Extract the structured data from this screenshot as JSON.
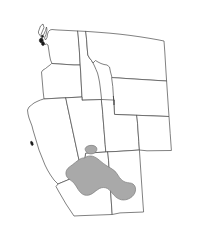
{
  "figure": {
    "kind": "species-range-map",
    "region_title": "Western United States",
    "width_px": 202,
    "height_px": 248,
    "background_color": "#ffffff"
  },
  "style": {
    "border_color": "#4a4a4a",
    "border_width_px": 0.7,
    "land_fill": "#ffffff",
    "range_fill": "#a9a9a9",
    "range_stroke": "#7d7d7d",
    "island_fill": "#1a1a1a"
  },
  "states": [
    {
      "name": "Washington",
      "code": "WA",
      "shaded": false,
      "path": "M 38.5 31.5 L 40.5 26.0 L 43.0 24.0 L 44.0 27.5 L 42.5 31.0 L 41.0 34.5 L 42.0 36.5 L 44.0 34.0 L 45.5 30.5 L 46.5 27.0 L 47.0 30.0 L 46.0 34.5 L 44.5 38.0 L 45.5 40.0 L 47.0 37.5 L 47.5 34.0 L 48.5 31.5 L 50.0 30.0 L 52.0 29.5 L 55.0 29.8 L 58.0 30.0 L 62.0 30.2 L 66.0 30.4 L 70.0 30.6 L 74.0 30.8 L 78.0 31.0 L 79.2 48.0 L 79.8 58.0 L 80.2 65.0 L 74.0 65.0 L 68.0 64.6 L 62.0 64.2 L 56.0 63.8 L 52.0 63.5 L 50.5 60.0 L 49.5 55.0 L 48.8 50.0 L 48.0 45.0 L 46.5 44.0 L 45.0 44.5 L 43.5 43.0 L 43.0 40.0 L 42.0 38.0 L 40.5 36.0 L 39.0 34.0 Z"
    },
    {
      "name": "Oregon",
      "code": "OR",
      "shaded": false,
      "path": "M 52.0 63.5 L 56.0 63.8 L 62.0 64.2 L 68.0 64.6 L 74.0 65.0 L 80.2 65.0 L 80.8 74.0 L 81.2 82.0 L 81.6 90.0 L 82.0 97.0 L 74.0 97.4 L 66.0 97.8 L 58.0 98.2 L 50.0 98.6 L 44.0 99.0 L 43.2 92.0 L 42.6 85.0 L 42.0 78.0 L 41.5 72.0 L 43.0 70.0 L 45.5 68.5 L 48.0 66.5 L 50.0 65.0 Z"
    },
    {
      "name": "Idaho",
      "code": "ID",
      "shaded": false,
      "path": "M 78.0 31.0 L 82.0 31.2 L 86.0 31.4 L 86.6 40.0 L 87.2 48.0 L 87.8 55.0 L 89.5 58.0 L 91.5 60.5 L 93.0 63.0 L 94.5 66.0 L 96.0 69.5 L 97.5 73.0 L 98.5 77.0 L 99.5 82.0 L 100.3 88.0 L 101.0 94.0 L 101.6 99.5 L 94.0 99.8 L 88.0 100.0 L 82.0 100.2 L 82.0 97.0 L 81.6 90.0 L 81.2 82.0 L 80.8 74.0 L 80.2 65.0 L 79.8 58.0 L 79.2 48.0 Z"
    },
    {
      "name": "Montana",
      "code": "MT",
      "shaded": false,
      "path": "M 86.0 31.4 L 92.0 31.8 L 100.0 32.4 L 110.0 33.2 L 120.0 34.2 L 130.0 35.4 L 140.0 36.8 L 150.0 38.4 L 158.0 39.8 L 164.0 41.0 L 164.8 52.0 L 165.4 62.0 L 166.0 72.0 L 166.6 81.0 L 158.0 80.5 L 150.0 80.0 L 142.0 79.5 L 134.0 79.0 L 126.0 78.5 L 119.0 78.0 L 112.0 77.6 L 110.5 72.0 L 109.5 67.0 L 107.0 65.0 L 104.0 64.5 L 101.0 63.5 L 98.0 62.0 L 95.5 60.5 L 93.0 63.0 L 91.5 60.5 L 89.5 58.0 L 87.8 55.0 L 87.2 48.0 L 86.6 40.0 Z"
    },
    {
      "name": "Wyoming",
      "code": "WY",
      "shaded": false,
      "path": "M 112.0 77.6 L 119.0 78.0 L 126.0 78.5 L 134.0 79.0 L 142.0 79.5 L 150.0 80.0 L 158.0 80.5 L 166.6 81.0 L 167.2 90.0 L 167.8 99.0 L 168.4 108.0 L 169.0 116.5 L 161.0 116.2 L 153.0 115.9 L 145.0 115.6 L 137.0 115.3 L 129.0 115.0 L 121.0 114.7 L 114.5 114.4 L 114.0 105.0 L 113.4 96.0 L 112.8 87.0 Z"
    },
    {
      "name": "California",
      "code": "CA",
      "shaded": false,
      "path": "M 44.0 99.0 L 50.0 98.6 L 58.0 98.2 L 66.0 97.8 L 67.0 104.0 L 68.5 111.0 L 70.0 118.0 L 71.5 125.0 L 73.0 132.0 L 74.5 139.0 L 76.0 146.0 L 77.5 153.0 L 79.0 160.0 L 80.5 167.0 L 82.0 174.0 L 76.0 176.5 L 70.0 179.0 L 64.0 181.5 L 58.0 184.0 L 54.0 180.0 L 50.5 175.0 L 47.5 170.0 L 45.0 165.0 L 43.0 160.0 L 41.0 155.0 L 39.0 150.0 L 37.5 145.0 L 36.0 140.0 L 34.5 135.0 L 33.0 130.0 L 32.0 126.0 L 30.5 122.0 L 29.0 118.0 L 28.0 114.0 L 27.5 110.0 L 29.0 107.0 L 31.5 105.0 L 34.0 103.0 L 37.0 101.5 L 40.0 100.2 Z"
    },
    {
      "name": "Nevada",
      "code": "NV",
      "shaded": false,
      "path": "M 66.0 97.8 L 74.0 97.4 L 82.0 97.0 L 82.0 100.2 L 88.0 100.0 L 94.0 99.8 L 101.6 99.5 L 102.2 107.0 L 102.8 114.5 L 103.4 122.0 L 104.0 129.5 L 104.6 137.0 L 105.2 144.5 L 105.8 152.0 L 99.0 152.4 L 92.0 152.8 L 86.0 153.2 L 82.0 174.0 L 80.5 167.0 L 79.0 160.0 L 77.5 153.0 L 76.0 146.0 L 74.5 139.0 L 73.0 132.0 L 71.5 125.0 L 70.0 118.0 L 68.5 111.0 L 67.0 104.0 Z"
    },
    {
      "name": "Utah",
      "code": "UT",
      "shaded": true,
      "path": "M 101.6 99.5 L 108.0 99.8 L 114.5 100.1 L 114.0 105.0 L 113.4 96.0 L 114.5 114.4 L 121.0 114.7 L 129.0 115.0 L 137.0 115.3 L 137.6 124.0 L 138.2 133.0 L 138.8 141.5 L 139.4 150.0 L 132.0 150.5 L 124.0 151.0 L 116.0 151.5 L 108.0 151.8 L 105.8 152.0 L 105.2 144.5 L 104.6 137.0 L 104.0 129.5 L 103.4 122.0 L 102.8 114.5 L 102.2 107.0 Z"
    },
    {
      "name": "Colorado",
      "code": "CO",
      "shaded": false,
      "path": "M 137.0 115.3 L 145.0 115.6 L 153.0 115.9 L 161.0 116.2 L 169.0 116.5 L 169.6 125.0 L 170.2 133.5 L 170.8 142.0 L 171.4 150.5 L 163.0 150.6 L 155.0 150.7 L 147.0 150.8 L 139.4 150.0 L 138.8 141.5 L 138.2 133.0 L 137.6 124.0 Z"
    },
    {
      "name": "Arizona",
      "code": "AZ",
      "shaded": true,
      "path": "M 86.0 153.2 L 92.0 152.8 L 99.0 152.4 L 105.8 152.0 L 108.0 151.8 L 108.6 161.0 L 109.2 170.0 L 109.8 179.0 L 110.4 188.0 L 111.0 197.0 L 111.6 206.0 L 112.2 214.5 L 104.0 214.8 L 96.0 215.1 L 88.0 215.4 L 80.0 215.7 L 74.0 216.0 L 70.0 210.0 L 66.0 204.0 L 62.5 198.0 L 59.0 192.0 L 56.0 186.5 L 58.0 184.0 L 64.0 181.5 L 70.0 179.0 L 76.0 176.5 L 82.0 174.0 L 84.0 164.0 Z"
    },
    {
      "name": "New Mexico",
      "code": "NM",
      "shaded": true,
      "path": "M 108.0 151.8 L 116.0 151.5 L 124.0 151.0 L 132.0 150.5 L 139.4 150.0 L 140.0 159.0 L 140.6 168.0 L 141.2 177.0 L 141.8 186.0 L 142.4 195.0 L 143.0 204.0 L 143.6 212.0 L 136.0 212.3 L 128.0 212.6 L 120.0 212.9 L 112.2 214.5 L 111.6 206.0 L 111.0 197.0 L 110.4 188.0 L 109.8 179.0 L 109.2 170.0 L 108.6 161.0 Z"
    }
  ],
  "coast_details": [
    {
      "name": "puget-sound-islands",
      "description": "dark islands in Puget Sound, northwest Washington",
      "path": "M 42.3 38.6 a 1.9 2.3 0 1 0 0.1 0.1 Z M 44.0 42.2 a 1.6 1.9 0 1 0 0.1 0.1 Z M 43.2 35.4 a 1.0 1.2 0 1 0 0.1 0.1 Z"
    },
    {
      "name": "san-francisco-bay",
      "description": "dark bay notch on the central California coast",
      "path": "M 31.2 141.0 l 1.6 1.2 l 0.6 2.6 l -1.4 1.0 l -1.2 -1.8 l -0.4 -2.0 Z"
    }
  ],
  "range": {
    "label": "shaded distribution range",
    "fill_color": "#a9a9a9",
    "outline_color": "#7d7d7d",
    "lobes": [
      {
        "name": "southern-utah-lobe",
        "description": "small detached patch straddling the Utah-Arizona border",
        "path": "M 86.5 152.0 C 85.0 150.4 84.6 148.6 86.0 147.2 C 88.0 145.4 91.5 144.8 94.2 145.8 C 96.6 146.7 97.4 148.6 96.6 150.6 C 95.9 152.4 94.0 153.6 91.8 153.9 C 89.6 154.2 87.6 153.3 86.5 152.0 Z"
      },
      {
        "name": "main-arizona-lobe",
        "description": "large range covering central and southern Arizona into southwest New Mexico",
        "path": "M 84.5 158.0 C 86.6 156.2 89.5 155.6 92.4 156.2 C 95.2 156.8 97.4 158.6 99.6 160.4 C 102.0 162.4 104.4 164.4 107.0 166.0 C 109.6 167.6 112.4 168.8 114.6 170.8 C 116.6 172.6 117.8 175.2 119.4 177.4 C 121.0 179.6 123.2 181.4 125.6 182.2 C 128.2 183.0 131.0 182.6 133.0 184.0 C 135.2 185.5 136.0 188.4 135.4 191.2 C 134.8 194.0 132.8 196.4 130.2 198.0 C 127.6 199.6 124.4 200.4 121.4 199.8 C 118.4 199.2 115.8 197.2 113.6 194.8 C 111.6 192.6 110.0 190.0 107.6 188.6 C 105.2 187.2 102.2 187.2 99.6 188.4 C 97.0 189.6 95.0 191.8 92.6 193.4 C 90.2 195.0 87.2 195.8 84.4 195.0 C 81.8 194.2 79.8 192.0 78.2 189.6 C 76.6 187.2 75.4 184.4 73.4 182.4 C 71.6 180.6 69.0 179.6 67.4 177.6 C 65.8 175.6 65.4 172.6 66.6 170.2 C 67.8 167.8 70.2 166.4 72.4 164.8 C 74.6 163.2 76.6 161.2 78.8 159.8 C 80.6 158.6 82.6 157.6 84.5 158.0 Z"
      }
    ]
  }
}
